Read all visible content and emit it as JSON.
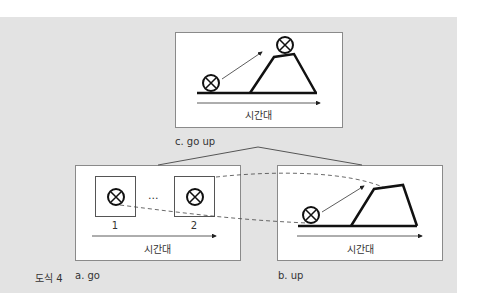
{
  "figure": {
    "label": "도식 4",
    "colors": {
      "panel": "#e3e3e3",
      "box_border": "#8a8a8a",
      "stroke": "#111111"
    }
  },
  "panels": {
    "top": {
      "caption": "c. go up",
      "axis_label": "시간대",
      "icon": "circled-x-icon"
    },
    "left": {
      "caption": "a. go",
      "axis_label": "시간대",
      "frames": [
        "1",
        "2"
      ],
      "ellipsis": "...",
      "icon": "circled-x-icon"
    },
    "right": {
      "caption": "b. up",
      "axis_label": "시간대",
      "icon": "circled-x-icon"
    }
  }
}
